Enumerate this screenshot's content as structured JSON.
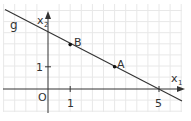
{
  "diagram": {
    "line_label": "g",
    "axis_x_label": "x",
    "axis_x_sub": "1",
    "axis_y_label": "x",
    "axis_y_sub": "2",
    "origin_label": "O",
    "tick_x1": "1",
    "tick_x5": "5",
    "tick_y1": "1",
    "point_a": {
      "label": "A",
      "x": 3,
      "y": 1
    },
    "point_b": {
      "label": "B",
      "x": 1,
      "y": 2
    },
    "line": {
      "x_intercept": 5,
      "y_intercept": 2.5,
      "slope": -0.5
    },
    "colors": {
      "grid": "#e6e6e6",
      "axis": "#333333",
      "line": "#333333"
    }
  }
}
